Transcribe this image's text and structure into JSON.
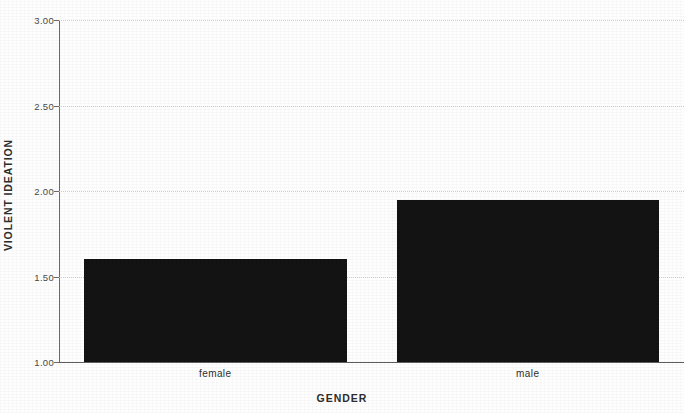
{
  "chart_data": {
    "type": "bar",
    "title": "",
    "subtitle": "",
    "xlabel": "GENDER",
    "ylabel": "VIOLENT IDEATION",
    "categories": [
      "female",
      "male"
    ],
    "values": [
      1.6,
      1.95
    ],
    "ylim": [
      1.0,
      3.0
    ],
    "yticks": [
      1.0,
      1.5,
      2.0,
      2.5,
      3.0
    ],
    "ytick_labels": [
      "1.00",
      "1.50",
      "2.00",
      "2.50",
      "3.00"
    ],
    "grid": true,
    "grid_axis": "y",
    "legend": false,
    "legend_position": "none",
    "bar_color": "#131313",
    "axis_color": "#6a6a6a",
    "grid_color": "#c9c9c9",
    "background_color": "#fefefe",
    "annotations": []
  }
}
